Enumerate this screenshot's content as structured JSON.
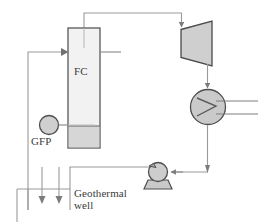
{
  "diagram": {
    "type": "process-flow-diagram",
    "colors": {
      "line": "#8a8a8a",
      "dark_line": "#5a5a5a",
      "fill_light": "#e4e4e4",
      "fill_mid": "#d2d2d2",
      "fill_dark": "#c2c2c2",
      "text": "#3b3b3b",
      "background": "#ffffff"
    },
    "labels": {
      "flash_chamber": "FC",
      "geothermal_fluid_pump": "GFP",
      "geothermal_well_line1": "Geothermal",
      "geothermal_well_line2": "well"
    },
    "components": [
      {
        "name": "flash-chamber",
        "label": "FC",
        "shape": "rectangle",
        "description": "Vertical flash chamber vessel with shaded liquid level at base"
      },
      {
        "name": "turbine",
        "label": "",
        "shape": "trapezoid",
        "description": "Steam turbine, inlet on narrow left side, exhaust from wide right side"
      },
      {
        "name": "condenser",
        "label": "",
        "shape": "circle-with-zigzag",
        "description": "Condenser heat exchanger with cooling water inlet and outlet lines on the right"
      },
      {
        "name": "geothermal-fluid-pump",
        "label": "GFP",
        "shape": "circle",
        "description": "Geothermal fluid pump feeding the flash chamber"
      },
      {
        "name": "condensate-pump",
        "label": "",
        "shape": "circle-on-base",
        "description": "Condensate pump returning fluid toward the reinjection header"
      },
      {
        "name": "geothermal-well",
        "label": "Geothermal well",
        "shape": "vertical-lines-with-arrows",
        "description": "Production and reinjection well lines with downward flow arrows"
      }
    ],
    "streams": [
      {
        "name": "flash-chamber-to-turbine",
        "from": "flash-chamber",
        "to": "turbine",
        "arrow": true
      },
      {
        "name": "turbine-to-condenser",
        "from": "turbine",
        "to": "condenser",
        "arrow": true
      },
      {
        "name": "condenser-to-pump",
        "from": "condenser",
        "to": "condensate-pump",
        "arrow": true
      },
      {
        "name": "pump-to-reinjection",
        "from": "condensate-pump",
        "to": "geothermal-well",
        "arrow": false
      },
      {
        "name": "well-to-flash-chamber",
        "from": "geothermal-well",
        "to": "flash-chamber",
        "arrow": true
      },
      {
        "name": "gfp-to-flash-chamber",
        "from": "geothermal-fluid-pump",
        "to": "flash-chamber",
        "arrow": false
      },
      {
        "name": "flash-chamber-brine-outlet",
        "from": "flash-chamber",
        "to": "",
        "arrow": false
      },
      {
        "name": "cooling-water-in",
        "from": "",
        "to": "condenser",
        "arrow": false
      },
      {
        "name": "cooling-water-out",
        "from": "condenser",
        "to": "",
        "arrow": false
      },
      {
        "name": "reinjection-down-1",
        "from": "geothermal-well",
        "to": "",
        "arrow": true
      },
      {
        "name": "reinjection-down-2",
        "from": "geothermal-well",
        "to": "",
        "arrow": true
      }
    ]
  }
}
